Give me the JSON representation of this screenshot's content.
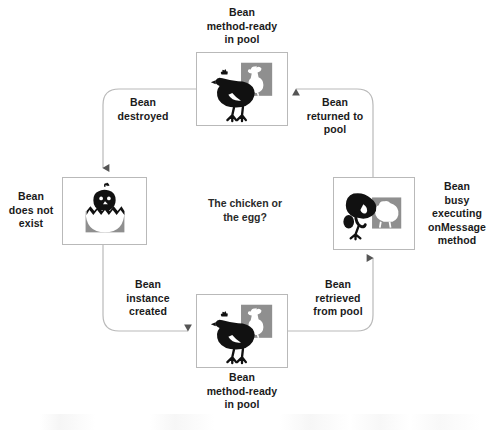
{
  "diagram": {
    "title_center": "The chicken or\nthe egg?",
    "stroke_color": "#b9b9b9",
    "ink_color": "#1a1a1a",
    "art_gray": "#8f8f8f",
    "nodes": [
      {
        "id": "top",
        "caption": "Bean\nmethod-ready\nin pool",
        "icon": "hen-with-rooster-panel-icon",
        "caption_position": "above"
      },
      {
        "id": "left",
        "caption": "Bean\ndoes not\nexist",
        "icon": "chick-hatching-from-egg-icon",
        "caption_position": "left"
      },
      {
        "id": "right",
        "caption": "Bean\nbusy\nexecuting\nonMessage\nmethod",
        "icon": "pecking-chicken-panel-icon",
        "caption_position": "right"
      },
      {
        "id": "bottom",
        "caption": "Bean\nmethod-ready\nin pool",
        "icon": "hen-with-rooster-panel-icon",
        "caption_position": "below"
      }
    ],
    "edges": [
      {
        "id": "top-to-left",
        "label": "Bean\ndestroyed",
        "from": "top",
        "to": "left"
      },
      {
        "id": "left-to-bottom",
        "label": "Bean\ninstance\ncreated",
        "from": "left",
        "to": "bottom"
      },
      {
        "id": "bottom-to-right",
        "label": "Bean\nretrieved\nfrom pool",
        "from": "bottom",
        "to": "right"
      },
      {
        "id": "right-to-top",
        "label": "Bean\nreturned to\npool",
        "from": "right",
        "to": "top"
      }
    ]
  }
}
